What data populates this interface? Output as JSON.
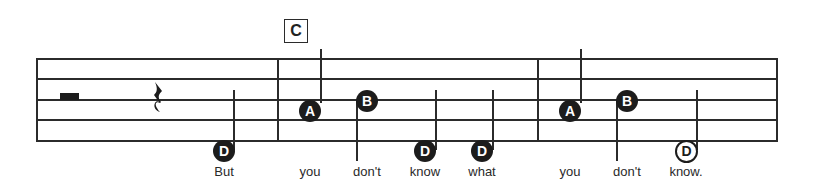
{
  "rehearsal_mark": "C",
  "staff": {
    "lines_y": [
      59,
      79,
      100,
      120,
      141
    ],
    "left_x": 37,
    "right_x": 777,
    "barlines_x": [
      277,
      537
    ]
  },
  "rests": [
    {
      "type": "half-rest",
      "measure": 1
    },
    {
      "type": "quarter-rest",
      "measure": 1
    }
  ],
  "notes": [
    {
      "letter": "D",
      "style": "filled",
      "x": 224,
      "y": 150,
      "stem": "up",
      "lyric": "But"
    },
    {
      "letter": "A",
      "style": "filled",
      "x": 310,
      "y": 110,
      "stem": "up",
      "lyric": "you"
    },
    {
      "letter": "B",
      "style": "filled",
      "x": 367,
      "y": 100,
      "stem": "down",
      "lyric": "don't"
    },
    {
      "letter": "D",
      "style": "filled",
      "x": 425,
      "y": 150,
      "stem": "up",
      "lyric": "know"
    },
    {
      "letter": "D",
      "style": "filled",
      "x": 482,
      "y": 150,
      "stem": "up",
      "lyric": "what"
    },
    {
      "letter": "A",
      "style": "filled",
      "x": 570,
      "y": 110,
      "stem": "up",
      "lyric": "you"
    },
    {
      "letter": "B",
      "style": "filled",
      "x": 627,
      "y": 100,
      "stem": "down",
      "lyric": "don't"
    },
    {
      "letter": "D",
      "style": "open",
      "x": 686,
      "y": 150,
      "stem": "up",
      "lyric": "know."
    }
  ]
}
